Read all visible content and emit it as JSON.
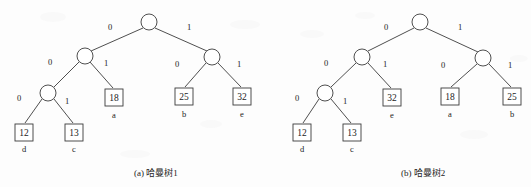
{
  "figure": {
    "background_color": "#fdfdfd",
    "ink_color": "#3b3b3b",
    "text_color": "#1c1c1c"
  },
  "trees": [
    {
      "id": "huffman-tree-1",
      "caption": "(a) 哈曼树1",
      "caption_x": 134,
      "caption_y": 166,
      "nodes": [
        {
          "name": "root",
          "cx": 149,
          "cy": 22,
          "r": 8
        },
        {
          "name": "internal-left",
          "cx": 85,
          "cy": 56,
          "r": 8
        },
        {
          "name": "internal-right",
          "cx": 212,
          "cy": 57,
          "r": 8
        },
        {
          "name": "internal-left-left",
          "cx": 48,
          "cy": 93,
          "r": 8
        }
      ],
      "leaves": [
        {
          "name": "leaf-12",
          "value": "12",
          "letter": "d",
          "x": 15,
          "y": 124,
          "w": 18,
          "h": 17,
          "letter_y": 144
        },
        {
          "name": "leaf-13",
          "value": "13",
          "letter": "c",
          "x": 65,
          "y": 124,
          "w": 18,
          "h": 17,
          "letter_y": 144
        },
        {
          "name": "leaf-18",
          "value": "18",
          "letter": "a",
          "x": 105,
          "y": 89,
          "w": 18,
          "h": 17,
          "letter_y": 110
        },
        {
          "name": "leaf-25",
          "value": "25",
          "letter": "b",
          "x": 175,
          "y": 88,
          "w": 18,
          "h": 17,
          "letter_y": 109
        },
        {
          "name": "leaf-32",
          "value": "32",
          "letter": "e",
          "x": 233,
          "y": 88,
          "w": 18,
          "h": 17,
          "letter_y": 109
        }
      ],
      "edges": [
        {
          "name": "edge-root-left",
          "x1": 143,
          "y1": 28,
          "x2": 91,
          "y2": 51,
          "label": "0",
          "lx": 108,
          "ly": 22
        },
        {
          "name": "edge-root-right",
          "x1": 155,
          "y1": 28,
          "x2": 207,
          "y2": 51,
          "label": "1",
          "lx": 187,
          "ly": 22
        },
        {
          "name": "edge-left-left",
          "x1": 79,
          "y1": 62,
          "x2": 54,
          "y2": 87,
          "label": "0",
          "lx": 48,
          "ly": 57
        },
        {
          "name": "edge-left-right",
          "x1": 90,
          "y1": 62,
          "x2": 113,
          "y2": 88,
          "label": "1",
          "lx": 104,
          "ly": 58
        },
        {
          "name": "edge-leftleft-left",
          "x1": 42,
          "y1": 99,
          "x2": 25,
          "y2": 123,
          "label": "0",
          "lx": 17,
          "ly": 93
        },
        {
          "name": "edge-leftleft-right",
          "x1": 54,
          "y1": 99,
          "x2": 73,
          "y2": 123,
          "label": "1",
          "lx": 65,
          "ly": 96
        },
        {
          "name": "edge-right-left",
          "x1": 206,
          "y1": 63,
          "x2": 185,
          "y2": 87,
          "label": "0",
          "lx": 175,
          "ly": 59
        },
        {
          "name": "edge-right-right",
          "x1": 218,
          "y1": 63,
          "x2": 241,
          "y2": 87,
          "label": "1",
          "lx": 237,
          "ly": 59
        }
      ]
    },
    {
      "id": "huffman-tree-2",
      "caption": "(b) 哈曼树2",
      "caption_x": 401,
      "caption_y": 166,
      "nodes": [
        {
          "name": "root",
          "cx": 420,
          "cy": 22,
          "r": 8
        },
        {
          "name": "internal-left",
          "cx": 362,
          "cy": 57,
          "r": 8
        },
        {
          "name": "internal-right",
          "cx": 483,
          "cy": 58,
          "r": 8
        },
        {
          "name": "internal-left-left",
          "cx": 325,
          "cy": 93,
          "r": 8
        }
      ],
      "leaves": [
        {
          "name": "leaf-12",
          "value": "12",
          "letter": "d",
          "x": 293,
          "y": 124,
          "w": 18,
          "h": 17,
          "letter_y": 144
        },
        {
          "name": "leaf-13",
          "value": "13",
          "letter": "c",
          "x": 343,
          "y": 124,
          "w": 18,
          "h": 17,
          "letter_y": 144
        },
        {
          "name": "leaf-32",
          "value": "32",
          "letter": "e",
          "x": 383,
          "y": 89,
          "w": 18,
          "h": 17,
          "letter_y": 110
        },
        {
          "name": "leaf-18",
          "value": "18",
          "letter": "a",
          "x": 441,
          "y": 88,
          "w": 18,
          "h": 17,
          "letter_y": 109
        },
        {
          "name": "leaf-25",
          "value": "25",
          "letter": "b",
          "x": 503,
          "y": 88,
          "w": 18,
          "h": 17,
          "letter_y": 109
        }
      ],
      "edges": [
        {
          "name": "edge-root-left",
          "x1": 414,
          "y1": 28,
          "x2": 368,
          "y2": 51,
          "label": "0",
          "lx": 384,
          "ly": 22
        },
        {
          "name": "edge-root-right",
          "x1": 426,
          "y1": 28,
          "x2": 478,
          "y2": 52,
          "label": "1",
          "lx": 458,
          "ly": 22
        },
        {
          "name": "edge-left-left",
          "x1": 356,
          "y1": 63,
          "x2": 331,
          "y2": 87,
          "label": "0",
          "lx": 324,
          "ly": 58
        },
        {
          "name": "edge-left-right",
          "x1": 368,
          "y1": 63,
          "x2": 391,
          "y2": 88,
          "label": "1",
          "lx": 383,
          "ly": 59
        },
        {
          "name": "edge-leftleft-left",
          "x1": 319,
          "y1": 99,
          "x2": 303,
          "y2": 123,
          "label": "0",
          "lx": 295,
          "ly": 93
        },
        {
          "name": "edge-leftleft-right",
          "x1": 331,
          "y1": 99,
          "x2": 351,
          "y2": 123,
          "label": "1",
          "lx": 343,
          "ly": 96
        },
        {
          "name": "edge-right-left",
          "x1": 477,
          "y1": 64,
          "x2": 451,
          "y2": 87,
          "label": "0",
          "lx": 441,
          "ly": 60
        },
        {
          "name": "edge-right-right",
          "x1": 489,
          "y1": 64,
          "x2": 511,
          "y2": 87,
          "label": "1",
          "lx": 508,
          "ly": 60
        }
      ]
    }
  ]
}
